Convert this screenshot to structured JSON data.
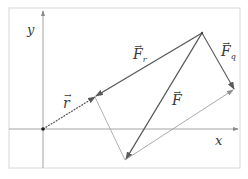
{
  "diagram": {
    "type": "vector-decomposition",
    "colors": {
      "frame": "#d8d8d8",
      "axis": "#9a9a9a",
      "vector_dark": "#5a5a5a",
      "vector_light": "#a0a0a0",
      "label": "#3a3a3a"
    },
    "axes": {
      "x_label": "x",
      "y_label": "y"
    },
    "points": {
      "origin": [
        43,
        129
      ],
      "r_tip": [
        95,
        97
      ],
      "apex": [
        202,
        33
      ],
      "fq_tip": [
        234,
        89
      ],
      "bottom": [
        125,
        160
      ]
    },
    "labels": {
      "r": {
        "main": "r",
        "arrow": "→"
      },
      "F_r": {
        "main": "F",
        "sub": "r",
        "arrow": "→"
      },
      "F_q": {
        "main": "F",
        "sub": "q",
        "arrow": "→"
      },
      "F": {
        "main": "F",
        "arrow": "→"
      }
    }
  }
}
